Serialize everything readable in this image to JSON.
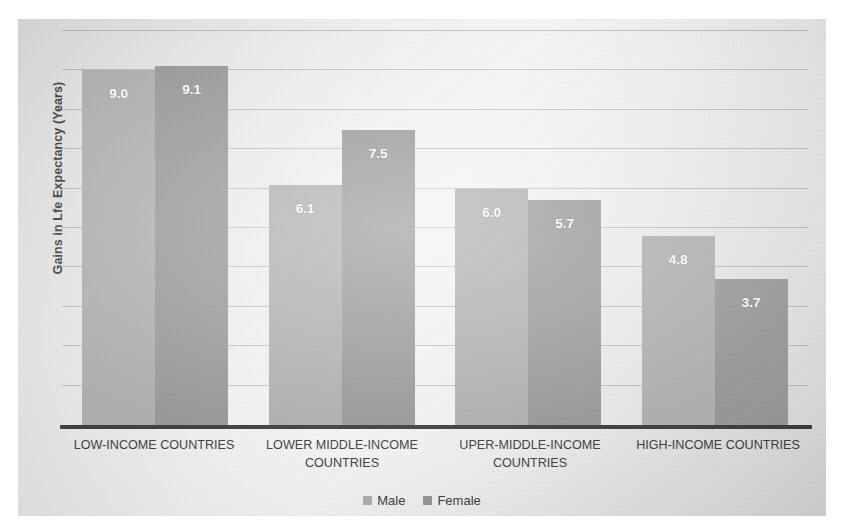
{
  "chart_data": {
    "type": "bar",
    "title": "",
    "subtitle": "",
    "xlabel": "",
    "ylabel": "Gains in Lfe Expectancy (Years)",
    "categories": [
      "LOW-INCOME COUNTRIES",
      "LOWER MIDDLE-INCOME COUNTRIES",
      "UPER-MIDDLE-INCOME COUNTRIES",
      "HIGH-INCOME COUNTRIES"
    ],
    "series": [
      {
        "name": "Male",
        "color": "#a8a8a8",
        "values": [
          9.0,
          6.1,
          6.0,
          4.8
        ],
        "labels": [
          "9.0",
          "6.1",
          "6.0",
          "4.8"
        ]
      },
      {
        "name": "Female",
        "color": "#8f8f8f",
        "values": [
          9.1,
          7.5,
          5.7,
          3.7
        ],
        "labels": [
          "9.1",
          "7.5",
          "5.7",
          "3.7"
        ]
      }
    ],
    "ylim": [
      0,
      10
    ],
    "y_gridline_values": [
      1,
      2,
      3,
      4,
      5,
      6,
      7,
      8,
      9,
      10
    ],
    "grid": true,
    "y_tick_labels_visible": false,
    "legend_position": "bottom",
    "baseline_color": "#2c2c2c",
    "background_color": "#e6e6e6",
    "value_label_color": "#ffffff"
  },
  "legend": {
    "items": [
      {
        "label": "Male"
      },
      {
        "label": "Female"
      }
    ]
  }
}
